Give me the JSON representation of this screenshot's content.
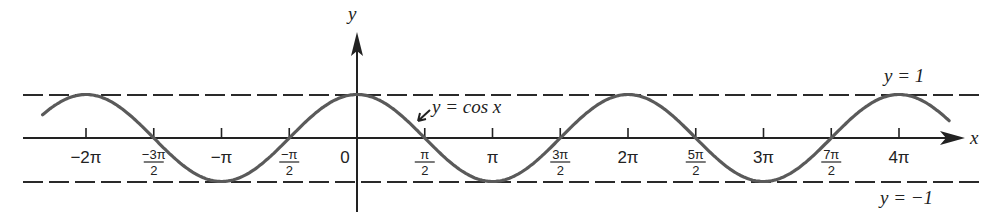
{
  "chart_data": {
    "type": "line",
    "title": "",
    "function": "y = cos x",
    "xlabel": "x",
    "ylabel": "y",
    "xlim_radians": [
      -2.32,
      4.37
    ],
    "ylim": [
      -1,
      1
    ],
    "grid": false,
    "legend": null,
    "x_ticks": [
      {
        "value": -2.0,
        "label": "-2π",
        "kind": "whole"
      },
      {
        "value": -1.5,
        "label": "-3π/2",
        "kind": "frac",
        "num": "-3π",
        "den": "2"
      },
      {
        "value": -1.0,
        "label": "-π",
        "kind": "whole"
      },
      {
        "value": -0.5,
        "label": "-π/2",
        "kind": "frac",
        "num": "-π",
        "den": "2"
      },
      {
        "value": 0.0,
        "label": "0",
        "kind": "origin"
      },
      {
        "value": 0.5,
        "label": "π/2",
        "kind": "frac",
        "num": "π",
        "den": "2"
      },
      {
        "value": 1.0,
        "label": "π",
        "kind": "whole"
      },
      {
        "value": 1.5,
        "label": "3π/2",
        "kind": "frac",
        "num": "3π",
        "den": "2"
      },
      {
        "value": 2.0,
        "label": "2π",
        "kind": "whole"
      },
      {
        "value": 2.5,
        "label": "5π/2",
        "kind": "frac",
        "num": "5π",
        "den": "2"
      },
      {
        "value": 3.0,
        "label": "3π",
        "kind": "whole"
      },
      {
        "value": 3.5,
        "label": "7π/2",
        "kind": "frac",
        "num": "7π",
        "den": "2"
      },
      {
        "value": 4.0,
        "label": "4π",
        "kind": "whole"
      }
    ],
    "x_tick_units": "multiples of π",
    "key_points": [
      {
        "x": "-2π",
        "y": 1
      },
      {
        "x": "-3π/2",
        "y": 0
      },
      {
        "x": "-π",
        "y": -1
      },
      {
        "x": "-π/2",
        "y": 0
      },
      {
        "x": "0",
        "y": 1
      },
      {
        "x": "π/2",
        "y": 0
      },
      {
        "x": "π",
        "y": -1
      },
      {
        "x": "3π/2",
        "y": 0
      },
      {
        "x": "2π",
        "y": 1
      },
      {
        "x": "5π/2",
        "y": 0
      },
      {
        "x": "3π",
        "y": -1
      },
      {
        "x": "7π/2",
        "y": 0
      },
      {
        "x": "4π",
        "y": 1
      }
    ],
    "reference_lines": [
      {
        "label": "y = 1",
        "y": 1,
        "style": "dashed"
      },
      {
        "label": "y = -1",
        "y": -1,
        "style": "dashed"
      }
    ],
    "annotations": [
      {
        "text": "y = cos x",
        "points_to": "curve near x = π/2"
      }
    ],
    "colors": {
      "curve": "#5a5a5a",
      "axes": "#222222",
      "dashes": "#2a2a2a"
    }
  },
  "labels": {
    "y_axis": "y",
    "x_axis": "x",
    "curve": "y = cos x",
    "upper_line": "y = 1",
    "lower_line": "y = −1",
    "origin": "0"
  }
}
